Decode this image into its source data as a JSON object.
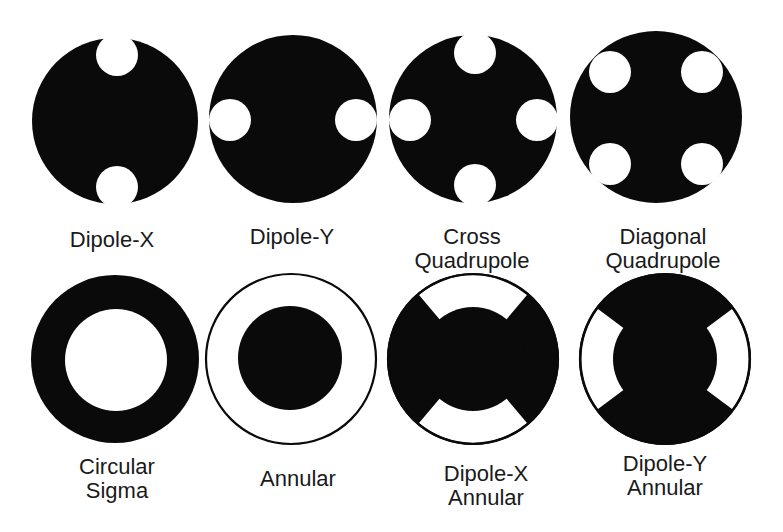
{
  "figure": {
    "colors": {
      "fill": "#0a0a0a",
      "background": "#ffffff",
      "text": "#1a1a1a"
    },
    "row1": [
      {
        "id": "dipole-x",
        "lines": [
          "Dipole-X"
        ]
      },
      {
        "id": "dipole-y",
        "lines": [
          "Dipole-Y"
        ]
      },
      {
        "id": "cross-quadrupole",
        "lines": [
          "Cross",
          "Quadrupole"
        ]
      },
      {
        "id": "diagonal-quadrupole",
        "lines": [
          "Diagonal",
          "Quadrupole"
        ]
      }
    ],
    "row2": [
      {
        "id": "circular-sigma",
        "lines": [
          "Circular",
          "Sigma"
        ]
      },
      {
        "id": "annular",
        "lines": [
          "Annular"
        ]
      },
      {
        "id": "dipole-x-annular",
        "lines": [
          "Dipole-X",
          "Annular"
        ]
      },
      {
        "id": "dipole-y-annular",
        "lines": [
          "Dipole-Y",
          "Annular"
        ]
      }
    ]
  }
}
